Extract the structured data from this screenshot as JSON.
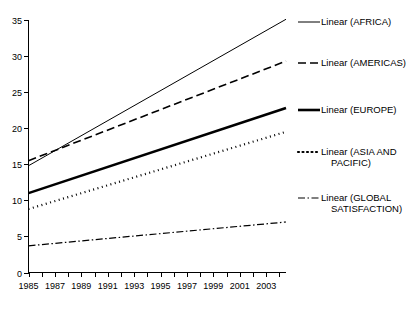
{
  "chart_data": {
    "type": "line",
    "title": "",
    "subtitle": "",
    "xlabel": "",
    "ylabel": "",
    "xlim": [
      1985,
      2004.5
    ],
    "ylim": [
      0,
      35
    ],
    "grid": false,
    "legend_position": "right",
    "x": [
      1985,
      2004.5
    ],
    "xticks": [
      1985,
      1986,
      1987,
      1988,
      1989,
      1990,
      1991,
      1992,
      1993,
      1994,
      1995,
      1996,
      1997,
      1998,
      1999,
      2000,
      2001,
      2002,
      2003,
      2004
    ],
    "xtick_labels": [
      "1985",
      "1987",
      "1989",
      "1991",
      "1993",
      "1995",
      "1997",
      "1999",
      "2001",
      "2003"
    ],
    "xtick_label_values": [
      1985,
      1987,
      1989,
      1991,
      1993,
      1995,
      1997,
      1999,
      2001,
      2003
    ],
    "yticks": [
      0,
      5,
      10,
      15,
      20,
      25,
      30,
      35
    ],
    "ytick_labels": [
      "0",
      "5",
      "10",
      "15",
      "20",
      "25",
      "30",
      "35"
    ],
    "series": [
      {
        "name": "Linear (AFRICA)",
        "style": "solid-thin",
        "color": "#000000",
        "width": 1,
        "dash": "none",
        "x": [
          1985,
          2004.5
        ],
        "values": [
          14.8,
          35.1
        ]
      },
      {
        "name": "Linear (AMERICAS)",
        "style": "dashed",
        "color": "#000000",
        "width": 1.6,
        "dash": "8 4",
        "x": [
          1985,
          2004.5
        ],
        "values": [
          15.5,
          29.3
        ]
      },
      {
        "name": "Linear (EUROPE)",
        "style": "solid-thick",
        "color": "#000000",
        "width": 2.6,
        "dash": "none",
        "x": [
          1985,
          2004.5
        ],
        "values": [
          11.0,
          22.8
        ]
      },
      {
        "name": "Linear (ASIA AND PACIFIC)",
        "style": "dotted",
        "color": "#000000",
        "width": 2.2,
        "dash": "1 3.5",
        "x": [
          1985,
          2004.5
        ],
        "values": [
          8.8,
          19.5
        ]
      },
      {
        "name": "Linear (GLOBAL SATISFACTION)",
        "style": "dash-dot",
        "color": "#000000",
        "width": 1.2,
        "dash": "7 2.5 1.5 2.5",
        "x": [
          1985,
          2004.5
        ],
        "values": [
          3.7,
          7.0
        ]
      }
    ]
  },
  "axes": {
    "y_tick_labels": [
      "35",
      "30",
      "25",
      "20",
      "15",
      "10",
      "5",
      "0"
    ],
    "x_tick_labels": [
      "1985",
      "1987",
      "1989",
      "1991",
      "1993",
      "1995",
      "1997",
      "1999",
      "2001",
      "2003"
    ]
  },
  "legend": {
    "items": [
      {
        "label": "Linear (AFRICA)",
        "label_line2": "",
        "swatch": "solid-thin-swatch"
      },
      {
        "label": "Linear (AMERICAS)",
        "label_line2": "",
        "swatch": "dashed-swatch"
      },
      {
        "label": "Linear (EUROPE)",
        "label_line2": "",
        "swatch": "solid-thick-swatch"
      },
      {
        "label": "Linear (ASIA AND",
        "label_line2": "PACIFIC)",
        "swatch": "dotted-swatch"
      },
      {
        "label": "Linear (GLOBAL",
        "label_line2": "SATISFACTION)",
        "swatch": "dash-dot-swatch"
      }
    ]
  }
}
